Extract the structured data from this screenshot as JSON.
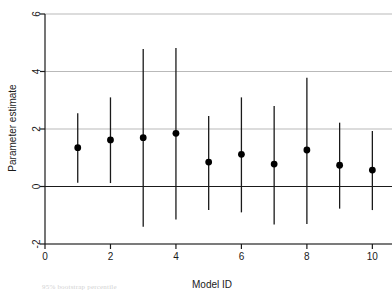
{
  "chart_data": {
    "type": "scatter",
    "title": "",
    "xlabel": "Model ID",
    "ylabel": "Parameter estimate",
    "xlim": [
      0,
      10.6
    ],
    "ylim": [
      -2,
      6
    ],
    "xticks": [
      0,
      2,
      4,
      6,
      8,
      10
    ],
    "yticks": [
      -2,
      0,
      2,
      4,
      6
    ],
    "xtick_labels": [
      "0",
      "2",
      "4",
      "6",
      "8",
      "10"
    ],
    "ytick_labels": [
      "-2",
      "0",
      "2",
      "4",
      "6"
    ],
    "grid": "horizontal",
    "legend": "none",
    "zero_line": 0,
    "marker": "filled-circle",
    "x": [
      1,
      2,
      3,
      4,
      5,
      6,
      7,
      8,
      9,
      10
    ],
    "categories": [
      "1",
      "2",
      "3",
      "4",
      "5",
      "6",
      "7",
      "8",
      "9",
      "10"
    ],
    "series": [
      {
        "name": "Parameter estimate",
        "values": [
          1.35,
          1.62,
          1.7,
          1.85,
          0.85,
          1.12,
          0.78,
          1.27,
          0.74,
          0.57
        ],
        "ci_lower": [
          0.13,
          0.12,
          -1.4,
          -1.15,
          -0.82,
          -0.9,
          -1.32,
          -1.3,
          -0.77,
          -0.82
        ],
        "ci_upper": [
          2.55,
          3.1,
          4.78,
          4.82,
          2.45,
          3.1,
          2.8,
          3.78,
          2.22,
          1.93
        ]
      }
    ],
    "colors": {
      "marker": "#000000",
      "errorbar": "#1a1a1a",
      "gridline": "#b9b9b9",
      "axis": "#1a1a1a",
      "background": "#ffffff"
    }
  },
  "caption": {
    "ghost_text": "95% bootstrap percentile"
  }
}
